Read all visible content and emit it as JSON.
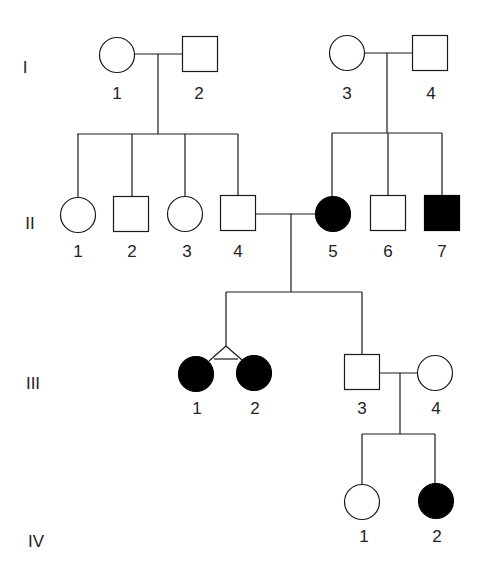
{
  "diagram": {
    "type": "pedigree",
    "colors": {
      "line": "#1a1a1a",
      "affected": "#000000",
      "unaffected": "#ffffff",
      "text": "#222222"
    },
    "generations": [
      {
        "label": "I",
        "x": 25,
        "y": 73
      },
      {
        "label": "II",
        "x": 30,
        "y": 229
      },
      {
        "label": "III",
        "x": 33,
        "y": 389
      },
      {
        "label": "IV",
        "x": 36,
        "y": 547
      }
    ],
    "individuals": [
      {
        "id": "I-1",
        "label": "1",
        "sex": "female",
        "affected": false,
        "cx": 117,
        "cy": 55,
        "lx": 117,
        "ly": 99
      },
      {
        "id": "I-2",
        "label": "2",
        "sex": "male",
        "affected": false,
        "cx": 200,
        "cy": 54,
        "lx": 199,
        "ly": 99
      },
      {
        "id": "I-3",
        "label": "3",
        "sex": "female",
        "affected": false,
        "cx": 347,
        "cy": 53,
        "lx": 347,
        "ly": 99
      },
      {
        "id": "I-4",
        "label": "4",
        "sex": "male",
        "affected": false,
        "cx": 430,
        "cy": 53,
        "lx": 431,
        "ly": 99
      },
      {
        "id": "II-1",
        "label": "1",
        "sex": "female",
        "affected": false,
        "cx": 78,
        "cy": 215,
        "lx": 78,
        "ly": 257
      },
      {
        "id": "II-2",
        "label": "2",
        "sex": "male",
        "affected": false,
        "cx": 131,
        "cy": 214,
        "lx": 132,
        "ly": 257
      },
      {
        "id": "II-3",
        "label": "3",
        "sex": "female",
        "affected": false,
        "cx": 185,
        "cy": 214,
        "lx": 187,
        "ly": 257
      },
      {
        "id": "II-4",
        "label": "4",
        "sex": "male",
        "affected": false,
        "cx": 238,
        "cy": 213,
        "lx": 238,
        "ly": 257
      },
      {
        "id": "II-5",
        "label": "5",
        "sex": "female",
        "affected": true,
        "cx": 333,
        "cy": 214,
        "lx": 333,
        "ly": 257
      },
      {
        "id": "II-6",
        "label": "6",
        "sex": "male",
        "affected": false,
        "cx": 388,
        "cy": 213,
        "lx": 388,
        "ly": 257
      },
      {
        "id": "II-7",
        "label": "7",
        "sex": "male",
        "affected": true,
        "cx": 442,
        "cy": 213,
        "lx": 442,
        "ly": 257
      },
      {
        "id": "III-1",
        "label": "1",
        "sex": "female",
        "affected": true,
        "cx": 196,
        "cy": 374,
        "lx": 197,
        "ly": 414
      },
      {
        "id": "III-2",
        "label": "2",
        "sex": "female",
        "affected": true,
        "cx": 254,
        "cy": 373,
        "lx": 255,
        "ly": 414
      },
      {
        "id": "III-3",
        "label": "3",
        "sex": "male",
        "affected": false,
        "cx": 362,
        "cy": 372,
        "lx": 362,
        "ly": 414
      },
      {
        "id": "III-4",
        "label": "4",
        "sex": "female",
        "affected": false,
        "cx": 435,
        "cy": 373,
        "lx": 436,
        "ly": 414
      },
      {
        "id": "IV-1",
        "label": "1",
        "sex": "female",
        "affected": false,
        "cx": 362,
        "cy": 502,
        "lx": 364,
        "ly": 542
      },
      {
        "id": "IV-2",
        "label": "2",
        "sex": "female",
        "affected": true,
        "cx": 436,
        "cy": 501,
        "lx": 437,
        "ly": 542
      }
    ],
    "relationships": [
      {
        "type": "mating",
        "partners": [
          "I-1",
          "I-2"
        ],
        "children": [
          "II-1",
          "II-2",
          "II-3",
          "II-4"
        ]
      },
      {
        "type": "mating",
        "partners": [
          "I-3",
          "I-4"
        ],
        "children": [
          "II-5",
          "II-6",
          "II-7"
        ]
      },
      {
        "type": "mating",
        "partners": [
          "II-4",
          "II-5"
        ],
        "children": [
          "III-1",
          "III-2",
          "III-3"
        ]
      },
      {
        "type": "twins",
        "zygosity": "monozygotic",
        "members": [
          "III-1",
          "III-2"
        ]
      },
      {
        "type": "mating",
        "partners": [
          "III-3",
          "III-4"
        ],
        "children": [
          "IV-1",
          "IV-2"
        ]
      }
    ],
    "lines": [
      {
        "name": "mating-line-I1-I2",
        "points": [
          [
            135,
            54
          ],
          [
            182,
            54
          ]
        ]
      },
      {
        "name": "descent-line-I1-I2",
        "points": [
          [
            158,
            54
          ],
          [
            158,
            134
          ]
        ]
      },
      {
        "name": "sibship-line-II-left",
        "points": [
          [
            77,
            134
          ],
          [
            238,
            134
          ]
        ]
      },
      {
        "name": "child-line-II1",
        "points": [
          [
            78,
            134
          ],
          [
            78,
            198
          ]
        ]
      },
      {
        "name": "child-line-II2",
        "points": [
          [
            132,
            134
          ],
          [
            132,
            197
          ]
        ]
      },
      {
        "name": "child-line-II3",
        "points": [
          [
            185,
            134
          ],
          [
            185,
            197
          ]
        ]
      },
      {
        "name": "child-line-II4",
        "points": [
          [
            238,
            134
          ],
          [
            238,
            196
          ]
        ]
      },
      {
        "name": "mating-line-I3-I4",
        "points": [
          [
            365,
            53
          ],
          [
            412,
            53
          ]
        ]
      },
      {
        "name": "descent-line-I3-I4",
        "points": [
          [
            387,
            53
          ],
          [
            387,
            133
          ]
        ]
      },
      {
        "name": "sibship-line-II-right",
        "points": [
          [
            332,
            133
          ],
          [
            442,
            133
          ]
        ]
      },
      {
        "name": "child-line-II5",
        "points": [
          [
            332,
            133
          ],
          [
            332,
            196
          ]
        ]
      },
      {
        "name": "child-line-II6",
        "points": [
          [
            388,
            133
          ],
          [
            388,
            196
          ]
        ]
      },
      {
        "name": "child-line-II7",
        "points": [
          [
            442,
            133
          ],
          [
            442,
            196
          ]
        ]
      },
      {
        "name": "mating-line-II4-II5",
        "points": [
          [
            255,
            214
          ],
          [
            315,
            214
          ]
        ]
      },
      {
        "name": "descent-line-II4-II5",
        "points": [
          [
            291,
            214
          ],
          [
            291,
            292
          ]
        ]
      },
      {
        "name": "sibship-line-III",
        "points": [
          [
            226,
            292
          ],
          [
            362,
            292
          ]
        ]
      },
      {
        "name": "twin-stem-line",
        "points": [
          [
            226,
            292
          ],
          [
            226,
            346
          ]
        ]
      },
      {
        "name": "twin-branch-left",
        "points": [
          [
            226,
            346
          ],
          [
            209,
            361
          ]
        ]
      },
      {
        "name": "twin-branch-right",
        "points": [
          [
            226,
            346
          ],
          [
            242,
            360
          ]
        ]
      },
      {
        "name": "twin-crossbar-monozygotic",
        "points": [
          [
            214,
            359
          ],
          [
            238,
            359
          ]
        ]
      },
      {
        "name": "child-line-III3",
        "points": [
          [
            362,
            292
          ],
          [
            362,
            355
          ]
        ]
      },
      {
        "name": "mating-line-III3-III4",
        "points": [
          [
            380,
            373
          ],
          [
            418,
            373
          ]
        ]
      },
      {
        "name": "descent-line-III3-III4",
        "points": [
          [
            400,
            373
          ],
          [
            400,
            434
          ]
        ]
      },
      {
        "name": "sibship-line-IV",
        "points": [
          [
            362,
            434
          ],
          [
            435,
            434
          ]
        ]
      },
      {
        "name": "child-line-IV1",
        "points": [
          [
            362,
            434
          ],
          [
            362,
            485
          ]
        ]
      },
      {
        "name": "child-line-IV2",
        "points": [
          [
            435,
            434
          ],
          [
            435,
            484
          ]
        ]
      }
    ],
    "symbol_size": {
      "circle_radius": 17.5,
      "square_size": 35
    }
  }
}
